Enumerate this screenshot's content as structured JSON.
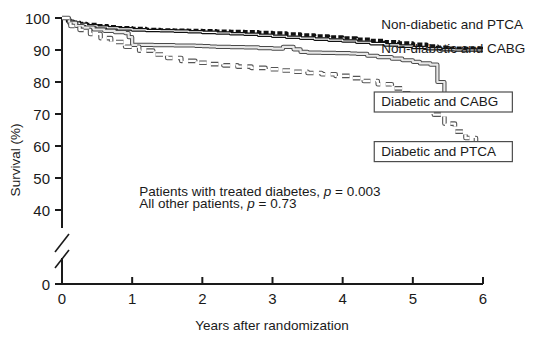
{
  "chart_data": {
    "type": "line",
    "title": "",
    "xlabel": "Years after randomization",
    "ylabel": "Survival (%)",
    "xlim": [
      0,
      6
    ],
    "ylim": [
      0,
      100
    ],
    "y_axis_break": true,
    "y_break_range": [
      0,
      40
    ],
    "xticks": [
      0,
      1,
      2,
      3,
      4,
      5,
      6
    ],
    "xticklabels": [
      "0",
      "1",
      "2",
      "3",
      "4",
      "5",
      "6"
    ],
    "yticks": [
      0,
      40,
      50,
      60,
      70,
      80,
      90,
      100
    ],
    "yticklabels": [
      "0",
      "40",
      "50",
      "60",
      "70",
      "80",
      "90",
      "100"
    ],
    "grid": false,
    "legend_position": "inline-right",
    "series": [
      {
        "name": "Non-diabetic and PTCA",
        "style": "thick-dashed-black",
        "label_x": 4.55,
        "label_y": 96.5,
        "boxed": false,
        "x": [
          0,
          0.08,
          0.16,
          0.25,
          0.35,
          0.5,
          0.65,
          0.8,
          1.0,
          1.2,
          1.4,
          1.6,
          1.8,
          2.0,
          2.2,
          2.4,
          2.6,
          2.8,
          3.0,
          3.2,
          3.4,
          3.6,
          3.8,
          4.0,
          4.2,
          4.4,
          4.6,
          4.8,
          5.0,
          5.2,
          5.35,
          5.5,
          5.7,
          6.0
        ],
        "y": [
          100,
          99.2,
          98.7,
          98.3,
          98.0,
          97.6,
          97.3,
          97.0,
          96.7,
          96.4,
          96.3,
          96.2,
          96.1,
          96.0,
          95.9,
          95.8,
          95.7,
          95.5,
          95.3,
          95.0,
          94.7,
          94.4,
          94.1,
          93.8,
          93.4,
          93.0,
          92.6,
          92.2,
          91.8,
          91.3,
          90.9,
          90.6,
          90.5,
          90.5
        ]
      },
      {
        "name": "Non-diabetic and CABG",
        "style": "thin-solid-double-black",
        "label_x": 4.55,
        "label_y": 89.0,
        "boxed": false,
        "x": [
          0,
          0.08,
          0.16,
          0.25,
          0.35,
          0.5,
          0.65,
          0.8,
          1.0,
          1.2,
          1.4,
          1.6,
          1.8,
          2.0,
          2.2,
          2.4,
          2.6,
          2.8,
          3.0,
          3.2,
          3.4,
          3.6,
          3.8,
          4.0,
          4.2,
          4.4,
          4.6,
          4.8,
          5.0,
          5.2,
          5.4,
          5.6,
          5.8,
          6.0
        ],
        "y": [
          100,
          99.0,
          98.4,
          98.0,
          97.6,
          97.2,
          96.9,
          96.6,
          96.3,
          96.1,
          96.0,
          95.9,
          95.7,
          95.5,
          95.3,
          95.1,
          94.9,
          94.6,
          94.3,
          94.0,
          93.7,
          93.4,
          93.1,
          92.8,
          92.4,
          92.0,
          91.6,
          91.2,
          90.8,
          90.4,
          90.1,
          90.0,
          90.0,
          90.0
        ]
      },
      {
        "name": "Diabetic and CABG",
        "style": "thin-solid-double-gray-step",
        "label_x": 4.55,
        "label_y": 72.5,
        "boxed": true,
        "x": [
          0,
          0.1,
          0.2,
          0.3,
          0.45,
          0.6,
          0.75,
          0.9,
          0.95,
          1.0,
          1.3,
          1.6,
          1.9,
          2.0,
          2.1,
          2.2,
          2.4,
          2.6,
          2.8,
          3.0,
          3.15,
          3.3,
          3.4,
          3.5,
          3.7,
          3.9,
          4.0,
          4.1,
          4.2,
          4.35,
          4.5,
          4.7,
          4.85,
          5.0,
          5.1,
          5.25,
          5.35,
          5.45,
          5.6,
          6.0
        ],
        "y": [
          100,
          98.5,
          97.5,
          97.0,
          96.4,
          96.0,
          95.6,
          95.3,
          94.0,
          91.6,
          91.5,
          91.4,
          91.3,
          91.2,
          91.1,
          91.0,
          90.9,
          90.8,
          90.6,
          90.4,
          91.0,
          90.2,
          89.4,
          89.2,
          89.1,
          89.0,
          89.0,
          88.9,
          88.8,
          88.2,
          87.8,
          87.3,
          86.8,
          86.3,
          85.8,
          85.4,
          80.0,
          75.6,
          75.5,
          75.5
        ]
      },
      {
        "name": "Diabetic and PTCA",
        "style": "dashed-open-square-gray",
        "label_x": 4.55,
        "label_y": 57.0,
        "boxed": true,
        "x": [
          0,
          0.12,
          0.25,
          0.4,
          0.55,
          0.7,
          0.9,
          1.1,
          1.3,
          1.5,
          1.7,
          1.9,
          2.1,
          2.3,
          2.5,
          2.7,
          2.9,
          3.1,
          3.3,
          3.5,
          3.7,
          3.9,
          4.1,
          4.3,
          4.5,
          4.7,
          4.85,
          5.0,
          5.15,
          5.3,
          5.45,
          5.6,
          5.75,
          5.9,
          6.0
        ],
        "y": [
          100,
          97.5,
          96.3,
          95.0,
          93.7,
          92.5,
          91.0,
          89.8,
          88.6,
          87.5,
          86.6,
          86.0,
          85.6,
          85.2,
          84.8,
          84.4,
          84.0,
          83.6,
          83.2,
          82.8,
          82.4,
          81.9,
          81.2,
          80.3,
          79.3,
          78.0,
          76.5,
          74.5,
          72.0,
          69.8,
          67.0,
          64.5,
          62.5,
          61.0,
          59.2
        ]
      }
    ],
    "annotations": [
      {
        "id": "p-diabetes",
        "text_plain": "Patients with treated diabetes, p = 0.003",
        "lead": "Patients with treated diabetes,",
        "p_symbol": "p",
        "p_value": "= 0.003",
        "x": 1.1,
        "y": 44.5
      },
      {
        "id": "p-other",
        "text_plain": "All other patients, p = 0.73",
        "lead": "All other patients,",
        "p_symbol": "p",
        "p_value": "= 0.73",
        "x": 1.1,
        "y": 40.5
      }
    ]
  },
  "colors": {
    "axis": "#1a1a1a",
    "text": "#1a1a1a",
    "series_dark": "#111111",
    "series_gray": "#8a8a8a",
    "background": "#ffffff",
    "box_border": "#4d4d4d"
  }
}
